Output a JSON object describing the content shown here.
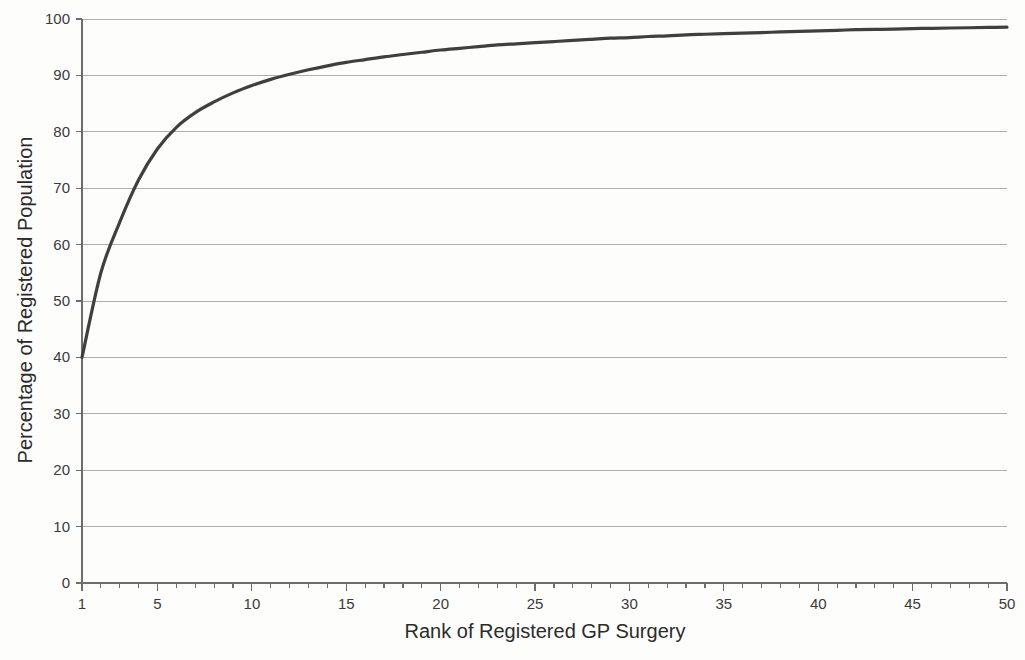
{
  "chart_data": {
    "type": "line",
    "title": "",
    "subtitle": "",
    "xlabel": "Rank of Registered GP Surgery",
    "ylabel": "Percentage of Registered Population",
    "xlim": [
      1,
      50
    ],
    "ylim": [
      0,
      100
    ],
    "grid": "horizontal",
    "legend": "none",
    "x_tick_labels": [
      "1",
      "5",
      "10",
      "15",
      "20",
      "25",
      "30",
      "35",
      "40",
      "45",
      "50"
    ],
    "x_ticks": [
      1,
      5,
      10,
      15,
      20,
      25,
      30,
      35,
      40,
      45,
      50
    ],
    "x_minor_tick_interval": 1,
    "y_tick_labels": [
      "0",
      "10",
      "20",
      "30",
      "40",
      "50",
      "60",
      "70",
      "80",
      "90",
      "100"
    ],
    "y_ticks": [
      0,
      10,
      20,
      30,
      40,
      50,
      60,
      70,
      80,
      90,
      100
    ],
    "series": [
      {
        "name": "Cumulative percentage of registered population",
        "color": "#3f3f3f",
        "x": [
          1,
          2,
          3,
          4,
          5,
          6,
          7,
          8,
          9,
          10,
          11,
          12,
          13,
          14,
          15,
          16,
          17,
          18,
          19,
          20,
          21,
          22,
          23,
          24,
          25,
          26,
          27,
          28,
          29,
          30,
          31,
          32,
          33,
          34,
          35,
          36,
          37,
          38,
          39,
          40,
          41,
          42,
          43,
          44,
          45,
          46,
          47,
          48,
          49,
          50
        ],
        "values": [
          40.0,
          55.0,
          64.0,
          71.5,
          77.0,
          80.8,
          83.4,
          85.3,
          86.9,
          88.2,
          89.3,
          90.2,
          91.0,
          91.7,
          92.3,
          92.8,
          93.3,
          93.7,
          94.1,
          94.5,
          94.8,
          95.1,
          95.4,
          95.6,
          95.8,
          96.0,
          96.2,
          96.4,
          96.6,
          96.7,
          96.9,
          97.0,
          97.2,
          97.3,
          97.4,
          97.5,
          97.6,
          97.7,
          97.8,
          97.9,
          98.0,
          98.1,
          98.15,
          98.2,
          98.3,
          98.35,
          98.4,
          98.45,
          98.5,
          98.55
        ]
      }
    ]
  },
  "axes": {
    "x_title": "Rank of Registered GP Surgery",
    "y_title": "Percentage of Registered Population"
  }
}
